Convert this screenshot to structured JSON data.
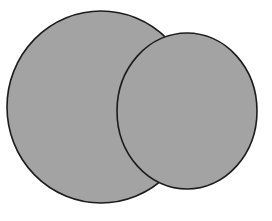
{
  "figure": {
    "width": 272,
    "height": 221,
    "background_color": "#ffffff",
    "shape_count": "2"
  },
  "style": {
    "fill_color": "#a3a3a3",
    "stroke_color": "#1c1c1c",
    "stroke_width": "1.6"
  },
  "chart_data": {
    "type": "scatter",
    "title": "",
    "xlabel": "",
    "ylabel": "",
    "grid": false,
    "legend": null,
    "xlim": [
      0,
      272
    ],
    "ylim": [
      0,
      221
    ],
    "shapes": [
      {
        "name": "left-circle",
        "kind": "ellipse",
        "cx": 101,
        "cy": 107,
        "rx": 94,
        "ry": 96,
        "fill": "#a3a3a3",
        "stroke": "#1c1c1c",
        "stroke_width": 1.6,
        "z": 1,
        "bbox": [
          7,
          11,
          195,
          203
        ]
      },
      {
        "name": "right-circle",
        "kind": "ellipse",
        "cx": 187,
        "cy": 111,
        "rx": 70,
        "ry": 78,
        "fill": "#a3a3a3",
        "stroke": "#1c1c1c",
        "stroke_width": 1.6,
        "z": 2,
        "bbox": [
          117,
          33,
          257,
          189
        ]
      }
    ],
    "intersections": [
      {
        "name": "upper-intersection",
        "x": 163,
        "y": 30
      },
      {
        "name": "lower-intersection",
        "x": 163,
        "y": 187
      }
    ]
  }
}
